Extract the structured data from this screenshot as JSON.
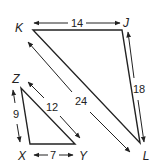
{
  "diagram": {
    "type": "similar-triangles",
    "triangles": [
      {
        "name": "KJL",
        "vertices": [
          {
            "label": "K",
            "x": 33,
            "y": 30
          },
          {
            "label": "J",
            "x": 122,
            "y": 30
          },
          {
            "label": "L",
            "x": 140,
            "y": 143
          }
        ],
        "sides": [
          {
            "from": "K",
            "to": "J",
            "length": "14"
          },
          {
            "from": "J",
            "to": "L",
            "length": "18"
          },
          {
            "from": "K",
            "to": "L",
            "length": "24"
          }
        ]
      },
      {
        "name": "ZXY",
        "vertices": [
          {
            "label": "Z",
            "x": 21,
            "y": 88
          },
          {
            "label": "X",
            "x": 30,
            "y": 144
          },
          {
            "label": "Y",
            "x": 75,
            "y": 144
          }
        ],
        "sides": [
          {
            "from": "Z",
            "to": "X",
            "length": "9"
          },
          {
            "from": "X",
            "to": "Y",
            "length": "7"
          },
          {
            "from": "Z",
            "to": "Y",
            "length": "12"
          }
        ]
      }
    ]
  },
  "labels": {
    "K": "K",
    "J": "J",
    "L": "L",
    "Z": "Z",
    "X": "X",
    "Y": "Y",
    "KJ": "14",
    "JL": "18",
    "KL": "24",
    "ZX": "9",
    "XY": "7",
    "ZY": "12"
  }
}
